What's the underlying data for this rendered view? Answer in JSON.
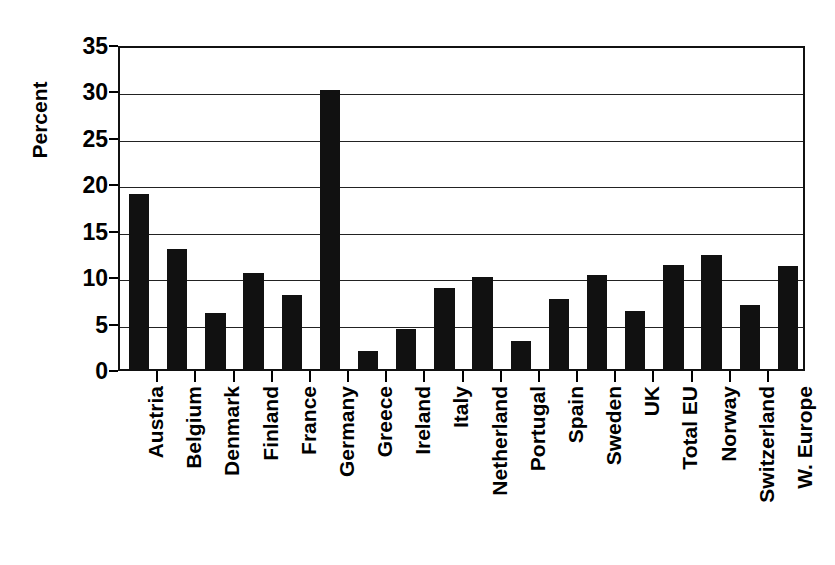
{
  "chart_data": {
    "type": "bar",
    "title": "",
    "xlabel": "",
    "ylabel": "Percent",
    "ylim": [
      0,
      35
    ],
    "ytick_values": [
      0,
      5,
      10,
      15,
      20,
      25,
      30,
      35
    ],
    "ytick_labels": [
      "0",
      "5",
      "10",
      "15",
      "20",
      "25",
      "30",
      "35"
    ],
    "grid": true,
    "legend": "none",
    "bar_color": "#111111",
    "categories": [
      "Austria",
      "Belgium",
      "Denmark",
      "Finland",
      "France",
      "Germany",
      "Greece",
      "Ireland",
      "Italy",
      "Netherland",
      "Portugal",
      "Spain",
      "Sweden",
      "UK",
      "Total EU",
      "Norway",
      "Switzerland",
      "W. Europe"
    ],
    "values": [
      18.8,
      12.9,
      6.0,
      10.3,
      8.0,
      30.0,
      1.9,
      4.3,
      8.7,
      9.9,
      3.0,
      7.5,
      10.1,
      6.2,
      11.2,
      12.3,
      6.9,
      11.1
    ]
  }
}
